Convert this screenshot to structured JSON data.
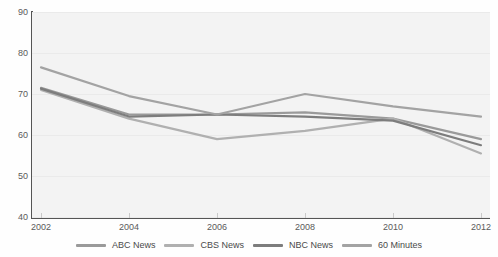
{
  "chart_data": {
    "type": "line",
    "title": "",
    "xlabel": "",
    "ylabel": "",
    "categories": [
      "2002",
      "2004",
      "2006",
      "2008",
      "2010",
      "2012"
    ],
    "x": [
      2002,
      2004,
      2006,
      2008,
      2010,
      2012
    ],
    "xlim": [
      2002,
      2012
    ],
    "ylim": [
      40,
      90
    ],
    "yticks": [
      40,
      50,
      60,
      70,
      80,
      90
    ],
    "ytick_labels": [
      "40",
      "50",
      "60",
      "70",
      "80",
      "90"
    ],
    "xtick_labels": [
      "2002",
      "2004",
      "2006",
      "2008",
      "2010",
      "2012"
    ],
    "grid": true,
    "legend_position": "bottom",
    "series": [
      {
        "name": "ABC News",
        "color": "#9a9a9a",
        "values": [
          71.5,
          65.0,
          65.0,
          65.5,
          64.0,
          59.0
        ]
      },
      {
        "name": "CBS News",
        "color": "#b0b0b0",
        "values": [
          71.0,
          64.0,
          59.0,
          61.0,
          64.0,
          55.5
        ]
      },
      {
        "name": "NBC News",
        "color": "#7d7d7d",
        "values": [
          71.3,
          64.5,
          65.0,
          64.5,
          63.5,
          57.5
        ]
      },
      {
        "name": "60 Minutes",
        "color": "#a3a3a3",
        "values": [
          76.5,
          69.5,
          65.0,
          70.0,
          67.0,
          64.5
        ]
      }
    ]
  },
  "legend": {
    "items": [
      {
        "label": "ABC News"
      },
      {
        "label": "CBS News"
      },
      {
        "label": "NBC News"
      },
      {
        "label": "60 Minutes"
      }
    ]
  },
  "colors": {
    "plot_background": "#f3f3f3",
    "page_background": "#ffffff",
    "axis": "#555555",
    "gridline": "#eaeaea",
    "tick_text": "#5a5a5a"
  }
}
